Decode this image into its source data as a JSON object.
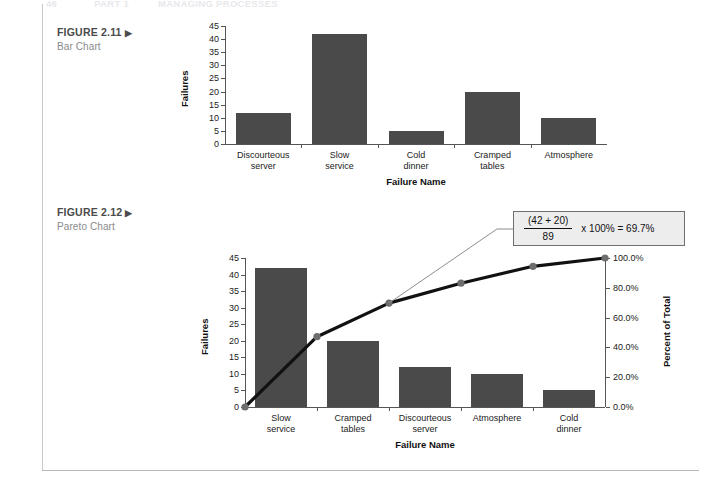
{
  "running_head": {
    "page_number": "46",
    "part": "PART 1",
    "title": "MANAGING PROCESSES"
  },
  "figures": [
    {
      "id": "fig-2-11",
      "caption_title": "FIGURE 2.11",
      "caption_arrow": "▶",
      "caption_sub": "Bar Chart"
    },
    {
      "id": "fig-2-12",
      "caption_title": "FIGURE 2.12",
      "caption_arrow": "▶",
      "caption_sub": "Pareto Chart"
    }
  ],
  "callout": {
    "numerator": "(42 + 20)",
    "denominator": "89",
    "rest": "x 100% = 69.7%"
  },
  "chart_data": [
    {
      "type": "bar",
      "title": "Bar Chart",
      "categories": [
        "Discourteous\nserver",
        "Slow\nservice",
        "Cold\ndinner",
        "Cramped\ntables",
        "Atmosphere"
      ],
      "values": [
        12,
        42,
        5,
        20,
        10
      ],
      "xlabel": "Failure Name",
      "ylabel": "Failures",
      "ylim": [
        0,
        45
      ],
      "yticks": [
        45,
        40,
        35,
        30,
        25,
        20,
        15,
        10,
        5,
        0
      ],
      "ytick_labels": [
        "45",
        "40",
        "35",
        "30",
        "25",
        "20",
        "15",
        "10",
        "5",
        "0"
      ],
      "grid": false,
      "bar_color": "#4a4a4a"
    },
    {
      "type": "bar",
      "title": "Pareto Chart",
      "categories": [
        "Slow\nservice",
        "Cramped\ntables",
        "Discourteous\nserver",
        "Atmosphere",
        "Cold\ndinner"
      ],
      "values": [
        42,
        20,
        12,
        10,
        5
      ],
      "xlabel": "Failure Name",
      "ylabel": "Failures",
      "ylim": [
        0,
        45
      ],
      "yticks": [
        45,
        40,
        35,
        30,
        25,
        20,
        15,
        10,
        5,
        0
      ],
      "ytick_labels": [
        "45",
        "40",
        "35",
        "30",
        "25",
        "20",
        "15",
        "10",
        "5",
        "0"
      ],
      "grid": false,
      "bar_color": "#4a4a4a",
      "secondary_axis": {
        "ylabel": "Percent of Total",
        "ylim": [
          0,
          100
        ],
        "yticks": [
          100,
          80,
          60,
          40,
          20,
          0
        ],
        "ytick_labels": [
          "100.0%",
          "80.0%",
          "60.0%",
          "40.0%",
          "20.0%",
          "0.0%"
        ]
      },
      "series": [
        {
          "name": "Cumulative Percent",
          "type": "line",
          "values": [
            0,
            47.2,
            69.7,
            83.1,
            94.4,
            100.0
          ],
          "line_color": "#111111",
          "marker_color": "#6e6e6e"
        }
      ],
      "annotation": "(42 + 20) / 89 x 100% = 69.7%"
    }
  ]
}
